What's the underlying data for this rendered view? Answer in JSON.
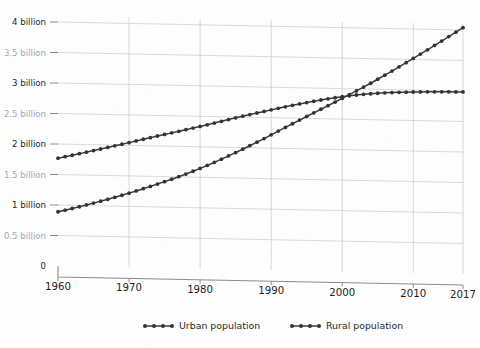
{
  "chart_data": {
    "type": "line",
    "title": "",
    "subtitle": "",
    "xlabel": "",
    "ylabel": "",
    "xlim": [
      1960,
      2017
    ],
    "ylim": [
      0,
      4250000000
    ],
    "grid": true,
    "legend_position": "bottom",
    "x_tick_labels": [
      "1960",
      "1970",
      "1980",
      "1990",
      "2000",
      "2010",
      "2017"
    ],
    "x_ticks": [
      1960,
      1970,
      1980,
      1990,
      2000,
      2010,
      2017
    ],
    "y_tick_labels": [
      "0",
      "0.5 billion",
      "1 billion",
      "1.5 billion",
      "2 billion",
      "2.5 billion",
      "3 billion",
      "3.5 billion",
      "4 billion"
    ],
    "y_ticks": [
      0,
      500000000,
      1000000000,
      1500000000,
      2000000000,
      2500000000,
      3000000000,
      3500000000,
      4000000000
    ],
    "x": [
      1960,
      1961,
      1962,
      1963,
      1964,
      1965,
      1966,
      1967,
      1968,
      1969,
      1970,
      1971,
      1972,
      1973,
      1974,
      1975,
      1976,
      1977,
      1978,
      1979,
      1980,
      1981,
      1982,
      1983,
      1984,
      1985,
      1986,
      1987,
      1988,
      1989,
      1990,
      1991,
      1992,
      1993,
      1994,
      1995,
      1996,
      1997,
      1998,
      1999,
      2000,
      2001,
      2002,
      2003,
      2004,
      2005,
      2006,
      2007,
      2008,
      2009,
      2010,
      2011,
      2012,
      2013,
      2014,
      2015,
      2016,
      2017
    ],
    "series": [
      {
        "name": "Urban population",
        "values": [
          1013000000,
          1045000000,
          1079000000,
          1114000000,
          1150000000,
          1187000000,
          1225000000,
          1263000000,
          1303000000,
          1344000000,
          1386000000,
          1430000000,
          1474000000,
          1520000000,
          1566000000,
          1614000000,
          1662000000,
          1712000000,
          1764000000,
          1818000000,
          1874000000,
          1932000000,
          1993000000,
          2055000000,
          2118000000,
          2182000000,
          2248000000,
          2316000000,
          2385000000,
          2455000000,
          2527000000,
          2599000000,
          2671000000,
          2742000000,
          2813000000,
          2883000000,
          2953000000,
          3023000000,
          3093000000,
          3163000000,
          3233000000,
          3305000000,
          3378000000,
          3452000000,
          3527000000,
          3604000000,
          3682000000,
          3762000000,
          3843000000,
          3924000000,
          4006000000,
          4089000000,
          4172000000,
          4256000000,
          4341000000,
          4426000000,
          4512000000,
          4599000000
        ]
      },
      {
        "name": "Rural population",
        "values": [
          2013000000,
          2043000000,
          2073000000,
          2104000000,
          2136000000,
          2168000000,
          2200000000,
          2232000000,
          2264000000,
          2296000000,
          2329000000,
          2363000000,
          2397000000,
          2430000000,
          2463000000,
          2495000000,
          2527000000,
          2559000000,
          2591000000,
          2624000000,
          2657000000,
          2691000000,
          2726000000,
          2761000000,
          2796000000,
          2831000000,
          2864000000,
          2897000000,
          2929000000,
          2961000000,
          2993000000,
          3025000000,
          3056000000,
          3086000000,
          3115000000,
          3143000000,
          3170000000,
          3196000000,
          3220000000,
          3243000000,
          3265000000,
          3284000000,
          3302000000,
          3318000000,
          3331000000,
          3343000000,
          3353000000,
          3361000000,
          3368000000,
          3374000000,
          3379000000,
          3383000000,
          3387000000,
          3390000000,
          3393000000,
          3395000000,
          3397000000,
          3399000000
        ]
      }
    ],
    "legend": [
      "Urban population",
      "Rural population"
    ],
    "colors": {
      "series": "#3b3b3b",
      "marker": "#333333",
      "grid": "#d2d2d2",
      "axis": "#8c8c8c",
      "text": "#1d1d1d",
      "text_faint": "#a8a8a8",
      "background": "#fdfdfd"
    }
  },
  "legend": {
    "items": [
      {
        "label": "Urban population"
      },
      {
        "label": "Rural population"
      }
    ]
  },
  "yaxis": {
    "labels": [
      {
        "text": "4 billion",
        "faint": false
      },
      {
        "text": "3.5 billion",
        "faint": true
      },
      {
        "text": "3 billion",
        "faint": false
      },
      {
        "text": "2.5 billion",
        "faint": true
      },
      {
        "text": "2 billion",
        "faint": false
      },
      {
        "text": "1.5 billion",
        "faint": true
      },
      {
        "text": "1 billion",
        "faint": false
      },
      {
        "text": "0.5 billion",
        "faint": true
      },
      {
        "text": "0",
        "faint": false
      }
    ]
  },
  "xaxis": {
    "labels": [
      "1960",
      "1970",
      "1980",
      "1990",
      "2000",
      "2010",
      "2017"
    ]
  }
}
